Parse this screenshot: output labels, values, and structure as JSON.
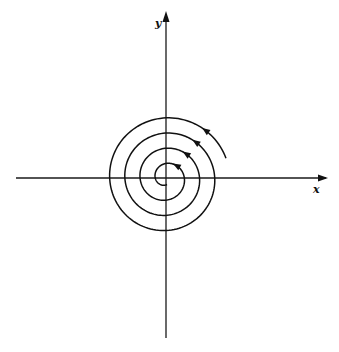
{
  "diagram": {
    "title": "",
    "axes": {
      "x_label": "x",
      "y_label": "y"
    },
    "curve": {
      "type": "spiral",
      "direction": "clockwise",
      "flow": "inward",
      "turns": 4,
      "arrow_count": 4,
      "description": "Trajectory spiraling toward the origin (stable focus)"
    },
    "colors": {
      "ink": "#111111",
      "background": "#ffffff"
    }
  }
}
